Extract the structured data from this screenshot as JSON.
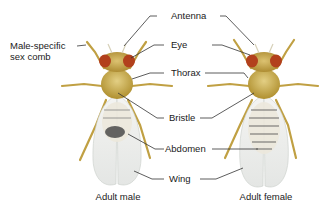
{
  "diagram": {
    "labels": {
      "sex_comb": [
        "Male-specific",
        "sex comb"
      ],
      "antenna": "Antenna",
      "eye": "Eye",
      "thorax": "Thorax",
      "bristle": "Bristle",
      "abdomen": "Abdomen",
      "wing": "Wing"
    },
    "captions": {
      "male": "Adult male",
      "female": "Adult female"
    },
    "colors": {
      "body": "#c9a94a",
      "body_dark": "#a8862c",
      "eye": "#b2401c",
      "wing": "#eef0ee",
      "leader_line": "#333333",
      "abdomen_band": "#555555"
    }
  }
}
